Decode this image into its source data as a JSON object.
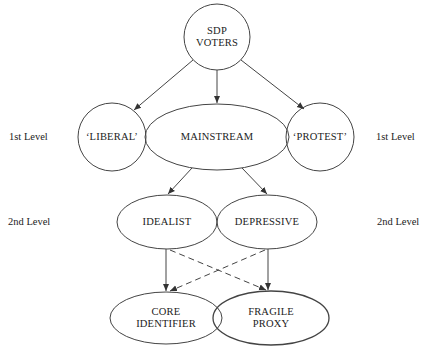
{
  "diagram": {
    "nodes": {
      "root": {
        "line1": "SDP",
        "line2": "VOTERS"
      },
      "liberal": {
        "label": "‘LIBERAL’"
      },
      "mainstream": {
        "label": "MAINSTREAM"
      },
      "protest": {
        "label": "‘PROTEST’"
      },
      "idealist": {
        "label": "IDEALIST"
      },
      "depressive": {
        "label": "DEPRESSIVE"
      },
      "core": {
        "line1": "CORE",
        "line2": "IDENTIFIER"
      },
      "fragile": {
        "line1": "FRAGILE",
        "line2": "PROXY"
      }
    },
    "level_labels": {
      "first_left": "1st Level",
      "first_right": "1st Level",
      "second_left": "2nd Level",
      "second_right": "2nd Level"
    },
    "edges": [
      {
        "from": "root",
        "to": "liberal",
        "style": "solid"
      },
      {
        "from": "root",
        "to": "mainstream",
        "style": "solid"
      },
      {
        "from": "root",
        "to": "protest",
        "style": "solid"
      },
      {
        "from": "mainstream",
        "to": "idealist",
        "style": "solid"
      },
      {
        "from": "mainstream",
        "to": "depressive",
        "style": "solid"
      },
      {
        "from": "idealist",
        "to": "core",
        "style": "solid"
      },
      {
        "from": "depressive",
        "to": "fragile",
        "style": "solid"
      },
      {
        "from": "idealist",
        "to": "fragile",
        "style": "dashed"
      },
      {
        "from": "depressive",
        "to": "core",
        "style": "dashed"
      }
    ]
  }
}
